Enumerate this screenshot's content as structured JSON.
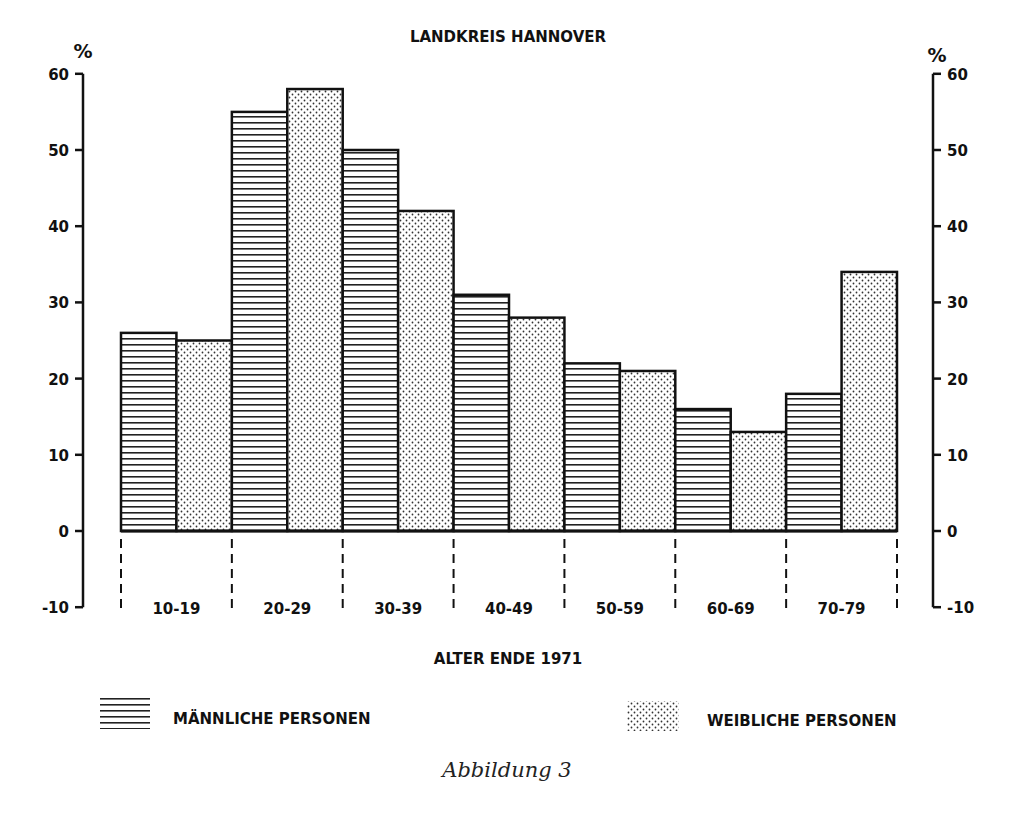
{
  "chart_data": {
    "type": "bar",
    "title": "LANDKREIS HANNOVER",
    "xlabel": "ALTER ENDE 1971",
    "ylabel": "%",
    "ylabel_right": "%",
    "ylim": [
      -10,
      60
    ],
    "yticks": [
      60,
      50,
      40,
      30,
      20,
      10,
      0,
      -10
    ],
    "grid": false,
    "legend_position": "bottom",
    "categories": [
      "10-19",
      "20-29",
      "30-39",
      "40-49",
      "50-59",
      "60-69",
      "70-79"
    ],
    "series": [
      {
        "name": "MÄNNLICHE PERSONEN",
        "pattern": "horizontal-lines",
        "values": [
          26,
          55,
          50,
          31,
          22,
          16,
          18
        ]
      },
      {
        "name": "WEIBLICHE PERSONEN",
        "pattern": "dots",
        "values": [
          25,
          58,
          42,
          28,
          21,
          13,
          34
        ]
      }
    ]
  },
  "caption": "Abbildung 3",
  "colors": {
    "ink": "#111111",
    "background": "#ffffff"
  }
}
